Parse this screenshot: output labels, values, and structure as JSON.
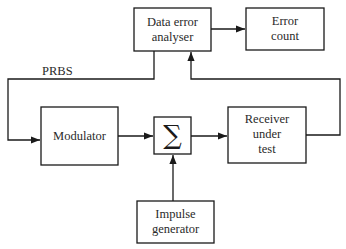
{
  "diagram": {
    "blocks": {
      "analyser": {
        "line1": "Data error",
        "line2": "analyser"
      },
      "error_count": {
        "line1": "Error",
        "line2": "count"
      },
      "modulator": {
        "line1": "Modulator"
      },
      "summer": {
        "symbol": "∑"
      },
      "receiver": {
        "line1": "Receiver",
        "line2": "under",
        "line3": "test"
      },
      "impulse": {
        "line1": "Impulse",
        "line2": "generator"
      }
    },
    "signals": {
      "prbs": "PRBS"
    },
    "connections": [
      {
        "from": "Data error analyser",
        "to": "Modulator",
        "label": "PRBS"
      },
      {
        "from": "Data error analyser",
        "to": "Error count"
      },
      {
        "from": "Modulator",
        "to": "Summer"
      },
      {
        "from": "Impulse generator",
        "to": "Summer"
      },
      {
        "from": "Summer",
        "to": "Receiver under test"
      },
      {
        "from": "Receiver under test",
        "to": "Data error analyser"
      }
    ]
  }
}
